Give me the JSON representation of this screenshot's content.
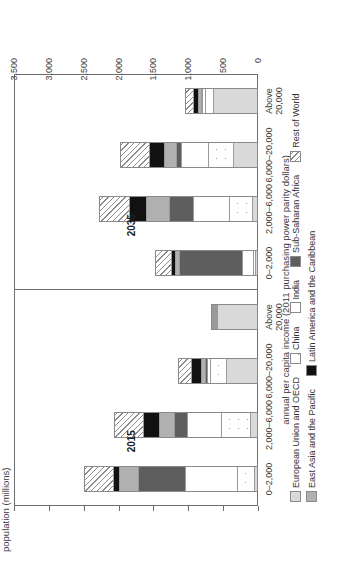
{
  "chart_data": {
    "type": "bar",
    "title": "",
    "xlabel": "annual per capita income (2011 purchasing power parity dollars)",
    "ylabel": "population (millions)",
    "ylim": [
      0,
      3500
    ],
    "yticks": [
      "0",
      "500",
      "1,000",
      "1,500",
      "2,000",
      "2,500",
      "3,000",
      "3,500"
    ],
    "ytick_values": [
      0,
      500,
      1000,
      1500,
      2000,
      2500,
      3000,
      3500
    ],
    "grid": false,
    "legend_position": "bottom",
    "orientation": "vertical-stacked",
    "panels": [
      "2015",
      "2035"
    ],
    "categories": [
      "0–2,000",
      "2,000–6,000",
      "6,000–20,000",
      "Above 20,000"
    ],
    "series": [
      {
        "name": "European Union and OECD",
        "key": "eu",
        "color": "#d9d9d9",
        "values_2015": [
          25,
          90,
          440,
          620
        ],
        "values_2035": [
          10,
          60,
          330,
          640
        ]
      },
      {
        "name": "China",
        "key": "cn",
        "color": "#ffffff-dotted",
        "values_2015": [
          250,
          420,
          230,
          20
        ],
        "values_2035": [
          30,
          330,
          370,
          110
        ]
      },
      {
        "name": "India",
        "key": "in",
        "color": "#ffffff",
        "values_2015": [
          750,
          500,
          50,
          5
        ],
        "values_2035": [
          160,
          520,
          390,
          40
        ]
      },
      {
        "name": "Sub-Saharan Africa",
        "key": "ssa",
        "color": "#5e5e5e",
        "values_2015": [
          680,
          180,
          30,
          5
        ],
        "values_2035": [
          930,
          360,
          75,
          25
        ]
      },
      {
        "name": "East Asia and the Pacific",
        "key": "eap",
        "color": "#b0b0b0",
        "values_2015": [
          280,
          220,
          60,
          5
        ],
        "values_2035": [
          60,
          330,
          180,
          45
        ]
      },
      {
        "name": "Latin America and the Caribbean",
        "key": "lac",
        "color": "#111111",
        "values_2015": [
          90,
          230,
          140,
          10
        ],
        "values_2035": [
          55,
          250,
          210,
          70
        ]
      },
      {
        "name": "Rest of World",
        "key": "row",
        "color": "#ffffff-hatched",
        "values_2015": [
          420,
          430,
          200,
          15
        ],
        "values_2035": [
          235,
          430,
          425,
          120
        ]
      }
    ],
    "totals_2015": [
      2495,
      2070,
      1150,
      680
    ],
    "totals_2035": [
      1480,
      2280,
      1980,
      1050
    ]
  },
  "axis": {
    "y_title": "population (millions)",
    "x_title": "annual per capita income (2011 purchasing power parity dollars)"
  },
  "legend": {
    "row1": [
      {
        "label": "European Union and OECD",
        "swatch": "eu"
      },
      {
        "label": "China",
        "swatch": "cn"
      },
      {
        "label": "India",
        "swatch": "in"
      },
      {
        "label": "Sub-Saharan Africa",
        "swatch": "ssa"
      },
      {
        "label": "Rest of World",
        "swatch": "row"
      }
    ],
    "row2": [
      {
        "label": "East Asia and the Pacific",
        "swatch": "eap"
      },
      {
        "label": "Latin America and the Caribbean",
        "swatch": "lac"
      }
    ]
  }
}
